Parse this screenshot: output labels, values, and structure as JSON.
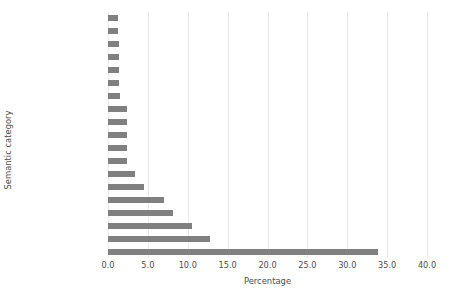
{
  "chart_data": {
    "type": "bar",
    "orientation": "horizontal",
    "title": "",
    "xlabel": "Percentage",
    "ylabel": "Semantic category",
    "xlim": [
      0.0,
      40.0
    ],
    "xticks": [
      "0.0",
      "5.0",
      "10.0",
      "15.0",
      "20.0",
      "25.0",
      "30.0",
      "35.0",
      "40.0"
    ],
    "xtick_values": [
      0.0,
      5.0,
      10.0,
      15.0,
      20.0,
      25.0,
      30.0,
      35.0,
      40.0
    ],
    "grid": "vertical",
    "legend": "none",
    "bar_color": "#808080",
    "background_color": "#ffffff",
    "gridline_color": "#eaeaea",
    "categories": [
      "text",
      "state",
      "reader",
      "perception",
      "institution",
      "ingestion",
      "education",
      "research",
      "experience",
      "employer",
      "communication",
      "cessation",
      "emotion",
      "event",
      "healthcare agent",
      "company",
      "writer",
      "treatment",
      "activity"
    ],
    "values": [
      1.3,
      1.3,
      1.4,
      1.4,
      1.4,
      1.4,
      1.5,
      2.4,
      2.4,
      2.4,
      2.4,
      2.4,
      3.4,
      4.5,
      7.0,
      8.1,
      10.5,
      12.8,
      33.8
    ]
  }
}
